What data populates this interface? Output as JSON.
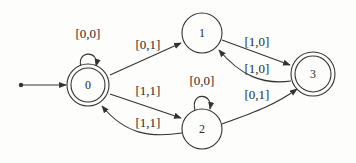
{
  "diagram": {
    "type": "finite-automaton",
    "start_state": "0",
    "states": [
      {
        "id": "0",
        "label": "0",
        "accepting": true
      },
      {
        "id": "1",
        "label": "1",
        "accepting": false
      },
      {
        "id": "2",
        "label": "2",
        "accepting": false
      },
      {
        "id": "3",
        "label": "3",
        "accepting": true
      }
    ],
    "transitions": [
      {
        "from": "0",
        "to": "0",
        "label": "[0,0]"
      },
      {
        "from": "0",
        "to": "1",
        "label": "[0,1]"
      },
      {
        "from": "0",
        "to": "2",
        "label": "[1,1]"
      },
      {
        "from": "2",
        "to": "0",
        "label": "[1,1]"
      },
      {
        "from": "2",
        "to": "2",
        "label": "[0,0]"
      },
      {
        "from": "1",
        "to": "3",
        "label": "[1,0]"
      },
      {
        "from": "3",
        "to": "1",
        "label": "[1,0]"
      },
      {
        "from": "2",
        "to": "3",
        "label": "[0,1]"
      }
    ]
  },
  "colors": {
    "stroke": "#333333",
    "background": "#fdfdfb"
  }
}
